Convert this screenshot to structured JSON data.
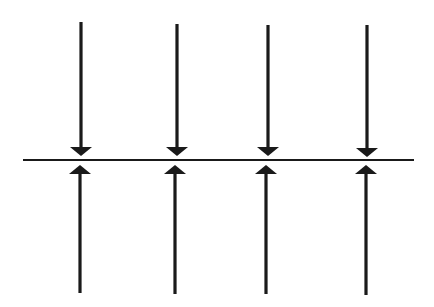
{
  "diagram": {
    "colors": {
      "background": "#ffffff",
      "stroke": "#1a1a1a"
    },
    "surface_line": {
      "x1": 23,
      "x2": 414,
      "y": 160
    },
    "arrows_down": [
      {
        "x": 81,
        "y_start": 22,
        "y_tip": 156
      },
      {
        "x": 177,
        "y_start": 24,
        "y_tip": 156
      },
      {
        "x": 268,
        "y_start": 25,
        "y_tip": 156
      },
      {
        "x": 367,
        "y_start": 25,
        "y_tip": 157
      }
    ],
    "arrows_up": [
      {
        "x": 80,
        "y_end": 293,
        "y_tip": 165
      },
      {
        "x": 175,
        "y_end": 294,
        "y_tip": 165
      },
      {
        "x": 266,
        "y_end": 294,
        "y_tip": 165
      },
      {
        "x": 366,
        "y_end": 295,
        "y_tip": 165
      }
    ]
  }
}
